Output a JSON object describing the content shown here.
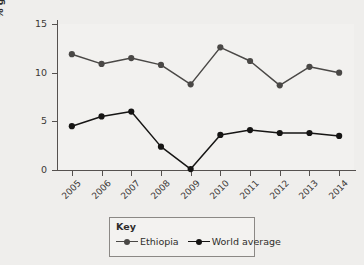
{
  "chart_data": {
    "type": "line",
    "title": "",
    "xlabel": "",
    "ylabel": "% growth each year",
    "categories": [
      "2005",
      "2006",
      "2007",
      "2008",
      "2009",
      "2010",
      "2011",
      "2012",
      "2013",
      "2014"
    ],
    "x": [
      2005,
      2006,
      2007,
      2008,
      2009,
      2010,
      2011,
      2012,
      2013,
      2014
    ],
    "ylim": [
      0,
      15
    ],
    "yticks": [
      0,
      5,
      10,
      15
    ],
    "ytick_labels": [
      "0",
      "5",
      "10",
      "15"
    ],
    "grid": false,
    "legend_position": "bottom-center",
    "series": [
      {
        "name": "Ethiopia",
        "color": "#4a4846",
        "marker": "circle",
        "values": [
          11.9,
          10.9,
          11.5,
          10.8,
          8.8,
          12.6,
          11.2,
          8.7,
          10.6,
          10.0
        ]
      },
      {
        "name": "World average",
        "color": "#161514",
        "marker": "circle",
        "values": [
          4.5,
          5.5,
          6.0,
          2.4,
          0.1,
          3.6,
          4.1,
          3.8,
          3.8,
          3.5
        ]
      }
    ]
  },
  "legend": {
    "title": "Key",
    "entries": [
      {
        "label": "Ethiopia",
        "color": "#4a4846"
      },
      {
        "label": "World average",
        "color": "#161514"
      }
    ]
  },
  "colors": {
    "background": "#efeeec",
    "plot_background": "#f2f1ef",
    "axis": "#55514f",
    "text": "#2f2d2b",
    "ethiopia": "#4a4846",
    "world_average": "#161514",
    "legend_border": "#8b8885"
  }
}
